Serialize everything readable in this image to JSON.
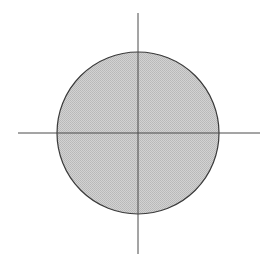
{
  "diagram": {
    "type": "circle-on-axes",
    "background": "#ffffff",
    "circle": {
      "cx": 138,
      "cy": 133,
      "r": 81,
      "fill": "#c8c8c8",
      "stroke": "#3a3a3a",
      "stroke_width": 1.2,
      "pattern": "fine-dither"
    },
    "axes": {
      "horizontal": {
        "x1": 18,
        "x2": 260,
        "y": 133
      },
      "vertical": {
        "x": 138,
        "y1": 13,
        "y2": 254
      },
      "stroke": "#4a4a4a",
      "stroke_width": 1
    }
  }
}
